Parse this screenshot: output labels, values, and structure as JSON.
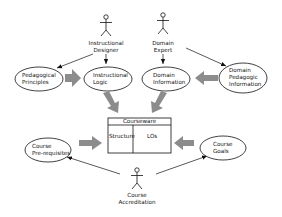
{
  "diagram": {
    "actors": [
      {
        "id": "instructional-designer",
        "line1": "Instructional",
        "line2": "Designer"
      },
      {
        "id": "domain-expert",
        "line1": "Domain",
        "line2": "Expert"
      },
      {
        "id": "course-accreditation",
        "line1": "Course",
        "line2": "Accreditation"
      }
    ],
    "ellipses": [
      {
        "id": "pedagogical-principles",
        "line1": "Pedagogical",
        "line2": "Principles"
      },
      {
        "id": "instructional-logic",
        "line1": "Instructional",
        "line2": "Logic"
      },
      {
        "id": "domain-information",
        "line1": "Domain",
        "line2": "Information"
      },
      {
        "id": "domain-pedagogic-information",
        "line1": "Domain",
        "line2": "Pedagogic",
        "line3": "Information"
      },
      {
        "id": "course-prerequisites",
        "line1": "Course",
        "line2": "Pre-requisites"
      },
      {
        "id": "course-goals",
        "line1": "Course",
        "line2": "Goals"
      }
    ],
    "courseware": {
      "title": "Courseware",
      "left_cell": "Structure",
      "right_cell": "LOs"
    },
    "colors": {
      "line": "#111111",
      "block_arrow": "#8c8c8c",
      "background": "#ffffff"
    }
  }
}
